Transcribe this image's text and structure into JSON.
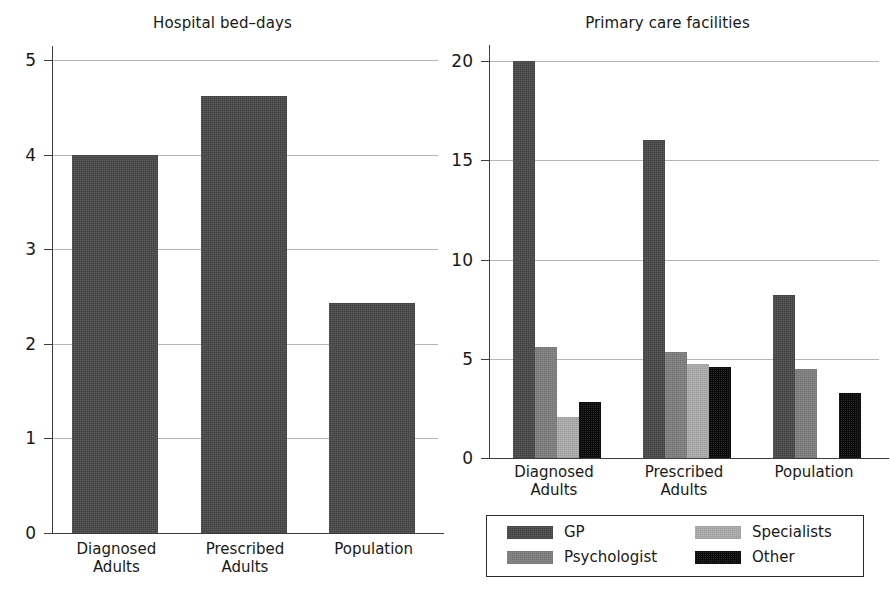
{
  "figure": {
    "background": "#ffffff",
    "bar_colors": {
      "GP": "#4a4a4a",
      "Psychologist": "#7e7e7e",
      "Specialists": "#a9a9a9",
      "Other": "#0d0d0d"
    }
  },
  "legend": {
    "position": "below-right-panel",
    "entries": [
      {
        "label": "GP",
        "color": "#4a4a4a",
        "swatch": "gp-swatch"
      },
      {
        "label": "Psychologist",
        "color": "#7e7e7e",
        "swatch": "psychologist-swatch"
      },
      {
        "label": "Specialists",
        "color": "#a9a9a9",
        "swatch": "specialists-swatch"
      },
      {
        "label": "Other",
        "color": "#0d0d0d",
        "swatch": "other-swatch"
      }
    ]
  },
  "chart_data": [
    {
      "id": "hospital-bed-days",
      "type": "bar",
      "title": "Hospital bed–days",
      "xlabel": "",
      "ylabel": "",
      "categories": [
        "Diagnosed\nAdults",
        "Prescribed\nAdults",
        "Population"
      ],
      "category_labels_flat": [
        "Diagnosed Adults",
        "Prescribed Adults",
        "Population"
      ],
      "values": [
        4.0,
        4.62,
        2.43
      ],
      "ylim": [
        0,
        5
      ],
      "yticks": [
        0,
        1,
        2,
        3,
        4,
        5
      ],
      "ytick_labels": [
        "0",
        "1",
        "2",
        "3",
        "4",
        "5"
      ],
      "grid": true,
      "legend": false,
      "series": [
        {
          "name": "bed-days",
          "color": "#4a4a4a",
          "values": [
            4.0,
            4.62,
            2.43
          ]
        }
      ]
    },
    {
      "id": "primary-care-facilities",
      "type": "bar",
      "title": "Primary care facilities",
      "xlabel": "",
      "ylabel": "",
      "categories": [
        "Diagnosed\nAdults",
        "Prescribed\nAdults",
        "Population"
      ],
      "category_labels_flat": [
        "Diagnosed Adults",
        "Prescribed Adults",
        "Population"
      ],
      "ylim": [
        0,
        20
      ],
      "yticks": [
        0,
        5,
        10,
        15,
        20
      ],
      "ytick_labels": [
        "0",
        "5",
        "10",
        "15",
        "20"
      ],
      "grid": true,
      "legend": true,
      "series": [
        {
          "name": "GP",
          "color": "#4a4a4a",
          "values": [
            20.0,
            16.0,
            8.2
          ]
        },
        {
          "name": "Psychologist",
          "color": "#7e7e7e",
          "values": [
            5.6,
            5.35,
            4.5
          ]
        },
        {
          "name": "Specialists",
          "color": "#a9a9a9",
          "values": [
            2.05,
            4.75,
            0.0
          ]
        },
        {
          "name": "Other",
          "color": "#0d0d0d",
          "values": [
            2.8,
            4.6,
            3.3
          ]
        }
      ]
    }
  ]
}
